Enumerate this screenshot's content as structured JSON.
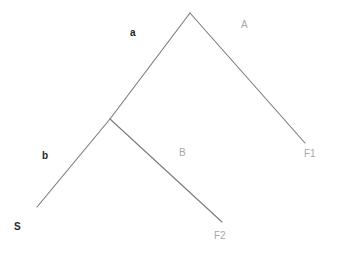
{
  "figure": {
    "kind": "tree-diagram",
    "background_color": "#ffffff",
    "branch_color": "#7a7a7a",
    "bold_label_color": "#262626",
    "light_label_color": "#a8a8a8"
  },
  "nodes": {
    "root": {
      "name": "root-node",
      "x": 190,
      "y": 13
    },
    "internal": {
      "name": "internal-node",
      "x": 110,
      "y": 119
    },
    "tip_s": {
      "name": "tip-s",
      "x": 37,
      "y": 207
    },
    "tip_f1": {
      "name": "tip-f1",
      "x": 305,
      "y": 143
    },
    "tip_f2": {
      "name": "tip-f2",
      "x": 222,
      "y": 222
    }
  },
  "branches": [
    {
      "id": "branch-a",
      "from": "root",
      "to": "internal",
      "label": "a",
      "x1": 190,
      "y1": 13,
      "x2": 110,
      "y2": 119
    },
    {
      "id": "branch-b",
      "from": "internal",
      "to": "tip_s",
      "label": "b",
      "x1": 110,
      "y1": 119,
      "x2": 37,
      "y2": 207
    },
    {
      "id": "branch-A",
      "from": "root",
      "to": "tip_f1",
      "label": "A",
      "x1": 190,
      "y1": 13,
      "x2": 305,
      "y2": 143
    },
    {
      "id": "branch-B",
      "from": "internal",
      "to": "tip_f2",
      "label": "B",
      "x1": 110,
      "y1": 119,
      "x2": 222,
      "y2": 222
    }
  ],
  "labels": {
    "branch_a": "a",
    "branch_b": "b",
    "branch_A": "A",
    "branch_B": "B",
    "tip_s": "S",
    "tip_f1": "F1",
    "tip_f2": "F2"
  }
}
